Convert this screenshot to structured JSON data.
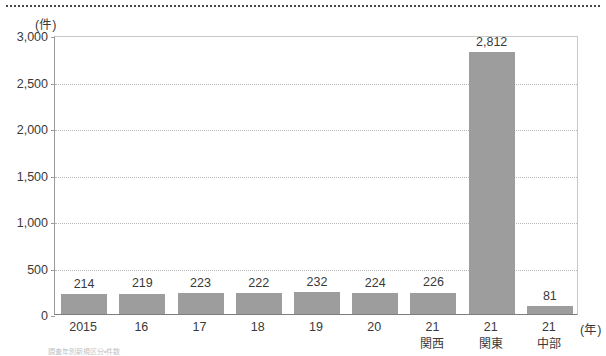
{
  "chart_data": {
    "type": "bar",
    "title": "",
    "subtitle": "",
    "unit_label": "(件)",
    "xlabel": "(年)",
    "ylabel": "",
    "ylim": [
      0,
      3000
    ],
    "ytick_values": [
      0,
      500,
      1000,
      1500,
      2000,
      2500,
      3000
    ],
    "ytick_labels": [
      "0",
      "500",
      "1,000",
      "1,500",
      "2,000",
      "2,500",
      "3,000"
    ],
    "grid": "horizontal-dotted",
    "legend": "none",
    "categories": [
      "2015",
      "16",
      "17",
      "18",
      "19",
      "20",
      "21",
      "21",
      "21"
    ],
    "category_sublabels": [
      "",
      "",
      "",
      "",
      "",
      "",
      "関西",
      "関東",
      "中部"
    ],
    "values": [
      214,
      219,
      223,
      222,
      232,
      224,
      226,
      2812,
      81
    ],
    "value_labels": [
      "214",
      "219",
      "223",
      "222",
      "232",
      "224",
      "226",
      "2,812",
      "81"
    ],
    "bar_color": "#9d9d9d",
    "grid_color": "#b9b9b9",
    "axis_color": "#7d7d7d",
    "text_color": "#3a3a3a",
    "background": "#ffffff"
  },
  "decor": {
    "top_rule": "dotted-divider"
  },
  "footnote": {
    "text": "調査年別新規区分・件数"
  }
}
